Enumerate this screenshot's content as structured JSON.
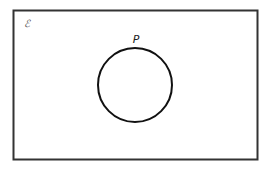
{
  "diagram": {
    "type": "venn",
    "universal_set_symbol": "ℰ",
    "sets": [
      {
        "label": "P"
      }
    ],
    "colors": {
      "stroke": "#222222",
      "background": "#ffffff"
    }
  }
}
